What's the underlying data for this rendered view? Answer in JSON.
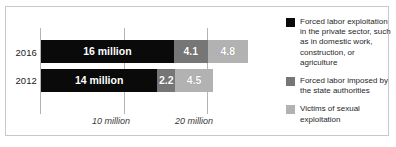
{
  "chart_data": {
    "type": "bar",
    "orientation": "horizontal",
    "stacked": true,
    "title": "",
    "xlabel": "",
    "ylabel": "",
    "categories": [
      "2016",
      "2012"
    ],
    "xlim": [
      0,
      30
    ],
    "xticks": [
      10,
      20
    ],
    "xticklabels": [
      "10 million",
      "20 million"
    ],
    "grid": true,
    "legend_position": "right",
    "series": [
      {
        "name": "Forced labor exploitation in the private sector, such as in domestic work, construction, or agriculture",
        "color": "#0a0a0a",
        "values": [
          16,
          14
        ],
        "labels": [
          "16 million",
          "14 million"
        ]
      },
      {
        "name": "Forced labor imposed by the state authorities",
        "color": "#767676",
        "values": [
          4.1,
          2.2
        ],
        "labels": [
          "4.1",
          "2.2"
        ]
      },
      {
        "name": "Victims of sexual exploitation",
        "color": "#b2b2b2",
        "values": [
          4.8,
          4.5
        ],
        "labels": [
          "4.8",
          "4.5"
        ]
      }
    ]
  },
  "axis": {
    "year_2016": "2016",
    "year_2012": "2012",
    "tick_10": "10 million",
    "tick_20": "20 million"
  },
  "bars": {
    "y2016": {
      "private": "16 million",
      "state": "4.1",
      "sexual": "4.8"
    },
    "y2012": {
      "private": "14 million",
      "state": "2.2",
      "sexual": "4.5"
    }
  },
  "legend": {
    "items": [
      {
        "swatch": "black-swatch",
        "label": "Forced labor exploitation in the private sector, such as in domestic work, construction, or agriculture"
      },
      {
        "swatch": "dark-gray-swatch",
        "label": "Forced labor imposed by the state authorities"
      },
      {
        "swatch": "light-gray-swatch",
        "label": "Victims of sexual exploitation"
      }
    ]
  },
  "misc": {
    "top_clipped_text": ""
  }
}
